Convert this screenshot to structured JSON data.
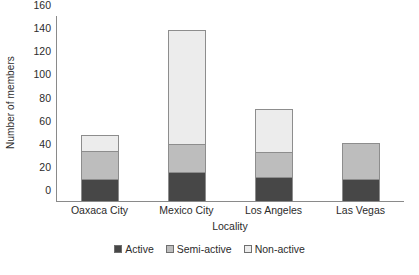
{
  "chart_data": {
    "type": "bar",
    "subtype": "stacked-vertical",
    "title": "",
    "xlabel": "Locality",
    "ylabel": "Number of members",
    "categories": [
      "Oaxaca City",
      "Mexico City",
      "Los Angeles",
      "Las Vegas"
    ],
    "series": [
      {
        "name": "Active",
        "values": [
          19,
          25,
          21,
          19
        ],
        "color": "#474747"
      },
      {
        "name": "Semi-active",
        "values": [
          25,
          25,
          22,
          32
        ],
        "color": "#bdbdbd"
      },
      {
        "name": "Non-active",
        "values": [
          15,
          100,
          38,
          0
        ],
        "color": "#ececec"
      }
    ],
    "totals": [
      59,
      150,
      81,
      51
    ],
    "ylim": [
      0,
      160
    ],
    "ytick_step": 20,
    "yticks": [
      0,
      20,
      40,
      60,
      80,
      100,
      120,
      140,
      160
    ],
    "ytick_labels": [
      "0",
      "20",
      "40",
      "60",
      "80",
      "100",
      "120",
      "140",
      "160"
    ],
    "grid": false,
    "legend_position": "bottom-center",
    "legend_entries": [
      "Active",
      "Semi-active",
      "Non-active"
    ],
    "axis_color": "#8a8a8a",
    "bar_border_color": "#8d8d8d"
  }
}
